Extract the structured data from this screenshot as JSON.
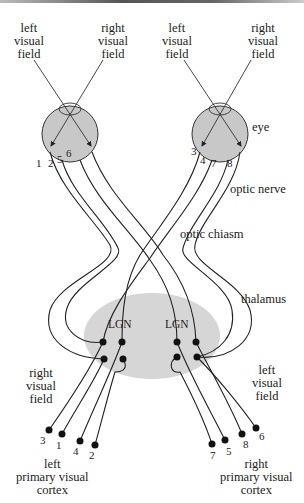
{
  "figure": {
    "colors": {
      "eye_fill": "#c8c8c8",
      "thalamus_fill": "#d6d6d6",
      "line": "#222222"
    }
  },
  "labels": {
    "left_eye": {
      "left_field": "left\nvisual\nfield",
      "right_field": "right\nvisual\nfield"
    },
    "right_eye": {
      "left_field": "left\nvisual\nfield",
      "right_field": "right\nvisual\nfield"
    },
    "eye": "eye",
    "optic_nerve": "optic nerve",
    "optic_chiasm": "optic chiasm",
    "thalamus": "thalamus",
    "lgn_left": "LGN",
    "lgn_right": "LGN",
    "right_visual_field_lower": "right\nvisual\nfield",
    "left_visual_field_lower": "left\nvisual\nfield",
    "left_cortex": "left\nprimary visual\ncortex",
    "right_cortex": "right\nprimary visual\ncortex"
  },
  "eye_fibers": {
    "left_eye": [
      "1",
      "2",
      "5",
      "6"
    ],
    "right_eye": [
      "3",
      "4",
      "7",
      "8"
    ]
  },
  "cortex_terminals": {
    "left": [
      "3",
      "1",
      "4",
      "2"
    ],
    "right": [
      "7",
      "5",
      "8",
      "6"
    ]
  }
}
